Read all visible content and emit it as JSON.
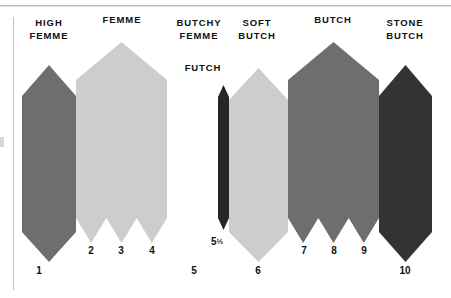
{
  "figure": {
    "background_color": "#ffffff",
    "axis_color": "#c2c2c2",
    "rule_color": "#b9b9b9",
    "text_color": "#111111"
  },
  "categories": [
    {
      "id": "high-femme",
      "label": "HIGH\nFEMME",
      "label_x": 49,
      "label_y": 17,
      "label_w": 60
    },
    {
      "id": "femme",
      "label": "FEMME",
      "label_x": 122,
      "label_y": 14,
      "label_w": 60
    },
    {
      "id": "butchy-femme",
      "label": "BUTCHY\nFEMME",
      "label_x": 199,
      "label_y": 17,
      "label_w": 60
    },
    {
      "id": "futch",
      "label": "FUTCH",
      "label_x": 203,
      "label_y": 62,
      "label_w": 52
    },
    {
      "id": "soft-butch",
      "label": "SOFT\nBUTCH",
      "label_x": 257,
      "label_y": 17,
      "label_w": 52
    },
    {
      "id": "butch",
      "label": "BUTCH",
      "label_x": 333,
      "label_y": 14,
      "label_w": 60
    },
    {
      "id": "stone-butch",
      "label": "STONE\nBUTCH",
      "label_x": 405,
      "label_y": 17,
      "label_w": 56
    }
  ],
  "scale_numbers": [
    {
      "value": "1",
      "x": 39,
      "y": 265
    },
    {
      "value": "2",
      "x": 91,
      "y": 245
    },
    {
      "value": "3",
      "x": 121,
      "y": 245
    },
    {
      "value": "4",
      "x": 152,
      "y": 245
    },
    {
      "value": "5",
      "x": 194,
      "y": 265
    },
    {
      "value": "5",
      "frac": "½",
      "x": 217,
      "y": 236
    },
    {
      "value": "6",
      "x": 258,
      "y": 265
    },
    {
      "value": "7",
      "x": 304,
      "y": 245
    },
    {
      "value": "8",
      "x": 334,
      "y": 245
    },
    {
      "value": "9",
      "x": 364,
      "y": 245
    },
    {
      "value": "10",
      "x": 405,
      "y": 265
    }
  ],
  "chart_data": {
    "type": "bar",
    "xlabel": "",
    "ylabel": "",
    "grid": false,
    "legend_position": "none",
    "orientation": "vertical",
    "note": "Arrow/chevron shaped bars: pointed apex on top, pointed chevron on bottom. Height encodes relative prominence.",
    "categories": [
      "HIGH FEMME",
      "FEMME",
      "BUTCHY FEMME",
      "FUTCH",
      "SOFT BUTCH",
      "BUTCH",
      "STONE BUTCH"
    ],
    "scale_points": [
      "1",
      "2",
      "3",
      "4",
      "5",
      "5½",
      "6",
      "7",
      "8",
      "9",
      "10"
    ],
    "bars": [
      {
        "name": "HIGH FEMME",
        "scale_labels": [
          "1"
        ],
        "color": "#6e6e6e",
        "x_left": 22,
        "x_right": 76,
        "apex_y": 65,
        "shoulder_y": 96,
        "body_bottom_y": 232,
        "tip_y": 262,
        "segments": 1
      },
      {
        "name": "FEMME",
        "scale_labels": [
          "2",
          "3",
          "4"
        ],
        "color": "#cdcdcd",
        "x_left": 76,
        "x_right": 167,
        "apex_y": 42,
        "shoulder_y": 80,
        "body_bottom_y": 218,
        "tip_y": 243,
        "segments": 3
      },
      {
        "name": "BUTCHY FEMME",
        "scale_labels": [
          "5"
        ],
        "color": "#ffffff",
        "x_left": 167,
        "x_right": 218,
        "apex_y": 0,
        "shoulder_y": 0,
        "body_bottom_y": 0,
        "tip_y": 0,
        "segments": 0,
        "empty": true
      },
      {
        "name": "FUTCH",
        "scale_labels": [
          "5½"
        ],
        "color": "#262626",
        "x_left": 218,
        "x_right": 229,
        "apex_y": 85,
        "shoulder_y": 97,
        "body_bottom_y": 218,
        "tip_y": 230,
        "segments": 1
      },
      {
        "name": "SOFT BUTCH",
        "scale_labels": [
          "6"
        ],
        "color": "#cdcdcd",
        "x_left": 229,
        "x_right": 288,
        "apex_y": 68,
        "shoulder_y": 100,
        "body_bottom_y": 232,
        "tip_y": 262,
        "segments": 1
      },
      {
        "name": "BUTCH",
        "scale_labels": [
          "7",
          "8",
          "9"
        ],
        "color": "#6e6e6e",
        "x_left": 288,
        "x_right": 379,
        "apex_y": 42,
        "shoulder_y": 80,
        "body_bottom_y": 218,
        "tip_y": 243,
        "segments": 3
      },
      {
        "name": "STONE BUTCH",
        "scale_labels": [
          "10"
        ],
        "color": "#333333",
        "x_left": 379,
        "x_right": 432,
        "apex_y": 65,
        "shoulder_y": 96,
        "body_bottom_y": 232,
        "tip_y": 262,
        "segments": 1
      }
    ]
  }
}
